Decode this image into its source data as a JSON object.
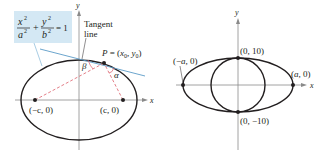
{
  "left_figure": {
    "equation": {
      "x_num": "x",
      "x_den": "a",
      "y_num": "y",
      "y_den": "b",
      "exp": "2",
      "plus": "+",
      "equals": "= 1",
      "box_color": "#d4e8f4"
    },
    "tangent_label_line1": "Tangent",
    "tangent_label_line2": "line",
    "point_label": "P = (x",
    "point_sub0": "0",
    "point_mid": ", y",
    "point_sub1": "0",
    "point_close": ")",
    "beta": "β",
    "alpha": "α",
    "focus_left": "(−c, 0)",
    "focus_right": "(c, 0)",
    "x_axis": "x",
    "y_axis": "y",
    "colors": {
      "curve": "#231f20",
      "tangent": "#5b9bc7",
      "dashed": "#e0707a",
      "axis": "#888888"
    }
  },
  "right_figure": {
    "top_point": "(0, 10)",
    "bottom_point": "(0, −10)",
    "left_vertex": "(−a, 0)",
    "right_vertex": "(a, 0)",
    "x_axis": "x",
    "y_axis": "y"
  }
}
